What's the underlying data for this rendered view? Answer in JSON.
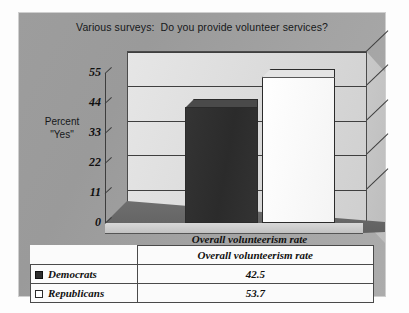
{
  "chart_data": {
    "type": "bar",
    "title": "Various surveys:  Do you provide volunteer services?",
    "ylabel_line1": "Percent",
    "ylabel_line2": "\"Yes\"",
    "xlabel": "",
    "categories": [
      "Overall volunteerism rate"
    ],
    "series": [
      {
        "name": "Democrats",
        "values": [
          42.5
        ],
        "color": "#2e2e2e"
      },
      {
        "name": "Republicans",
        "values": [
          53.7
        ],
        "color": "#ffffff"
      }
    ],
    "ylim": [
      0,
      55
    ],
    "yticks": [
      0,
      11,
      22,
      33,
      44,
      55
    ],
    "ytick_labels": [
      "0",
      "11",
      "22",
      "33",
      "44",
      "55"
    ],
    "grid": true,
    "legend_position": "bottom-table",
    "three_d": true
  },
  "table": {
    "header_blank": "",
    "header_category": "Overall volunteerism rate",
    "rows": [
      {
        "label": "Democrats",
        "swatch": "filled-dark-square",
        "value": "42.5"
      },
      {
        "label": "Republicans",
        "swatch": "outline-white-square",
        "value": "53.7"
      }
    ]
  },
  "colors": {
    "canvas_background": "#9d9d9d",
    "plot_wall": "#dcdcdc",
    "democrat_bar": "#2e2e2e",
    "republican_bar": "#ffffff",
    "axis_line": "#3d3d3d",
    "floor": "#5d5d5d"
  }
}
